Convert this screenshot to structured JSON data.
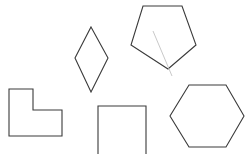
{
  "figure": {
    "canvas": {
      "width": 250,
      "height": 154,
      "background_color": "#ffffff"
    },
    "style": {
      "outline_color": "#3a3a3a",
      "outline_width": 1.1,
      "annotation_color": "#c9c9c9",
      "annotation_width": 1,
      "fill": "none"
    }
  },
  "chart_data": {
    "type": "diagram",
    "shape_count": 6,
    "shapes": [
      {
        "name": "l-shape",
        "label": "L-shape",
        "kind": "polygon",
        "vertices": [
          [
            9,
            89
          ],
          [
            33,
            89
          ],
          [
            33,
            110
          ],
          [
            62,
            110
          ],
          [
            62,
            136
          ],
          [
            9,
            136
          ]
        ],
        "closed": true,
        "stroke": "#3a3a3a",
        "fill": "none",
        "clipped_by_canvas": false
      },
      {
        "name": "diamond",
        "label": "Diamond",
        "kind": "polygon",
        "vertices": [
          [
            91,
            27
          ],
          [
            108,
            58
          ],
          [
            91,
            92
          ],
          [
            75,
            58
          ]
        ],
        "closed": true,
        "stroke": "#3a3a3a",
        "fill": "none",
        "clipped_by_canvas": false
      },
      {
        "name": "pentagon",
        "label": "Pentagon",
        "kind": "polygon",
        "vertices": [
          [
            143,
            6
          ],
          [
            182,
            6
          ],
          [
            196,
            45
          ],
          [
            168,
            69
          ],
          [
            131,
            45
          ]
        ],
        "closed": true,
        "stroke": "#3a3a3a",
        "fill": "none",
        "clipped_by_canvas": false
      },
      {
        "name": "square",
        "label": "Square",
        "kind": "polygon",
        "vertices": [
          [
            98,
            106
          ],
          [
            146,
            106
          ],
          [
            146,
            158
          ],
          [
            98,
            158
          ]
        ],
        "closed": true,
        "stroke": "#3a3a3a",
        "fill": "none",
        "clipped_by_canvas": true
      },
      {
        "name": "hexagon",
        "label": "Hexagon",
        "kind": "polygon",
        "vertices": [
          [
            189,
            85
          ],
          [
            226,
            85
          ],
          [
            244,
            116
          ],
          [
            226,
            147
          ],
          [
            189,
            147
          ],
          [
            170,
            116
          ]
        ],
        "closed": true,
        "stroke": "#3a3a3a",
        "fill": "none",
        "clipped_by_canvas": false
      },
      {
        "name": "pentagon-annotation-line",
        "label": "Line segment through pentagon",
        "kind": "line",
        "vertices": [
          [
            153,
            31
          ],
          [
            172,
            76
          ]
        ],
        "closed": false,
        "stroke": "#c9c9c9",
        "fill": "none",
        "clipped_by_canvas": false
      }
    ]
  }
}
